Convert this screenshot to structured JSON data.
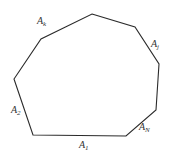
{
  "diagram": {
    "type": "polygon",
    "stroke_color": "#2b2b2b",
    "vertices": [
      [
        92,
        14
      ],
      [
        135,
        27
      ],
      [
        159,
        64
      ],
      [
        156,
        110
      ],
      [
        126,
        136
      ],
      [
        33,
        135
      ],
      [
        14,
        79
      ],
      [
        41,
        39
      ]
    ],
    "labels": [
      {
        "id": "A_k",
        "base": "A",
        "sub": "k",
        "x": 37,
        "y": 24
      },
      {
        "id": "A_j",
        "base": "A",
        "sub": "j",
        "x": 151,
        "y": 47
      },
      {
        "id": "A_2",
        "base": "A",
        "sub": "2",
        "x": 11,
        "y": 113
      },
      {
        "id": "A_N",
        "base": "A",
        "sub": "N",
        "x": 139,
        "y": 130
      },
      {
        "id": "A_1",
        "base": "A",
        "sub": "1",
        "x": 79,
        "y": 148
      }
    ]
  }
}
